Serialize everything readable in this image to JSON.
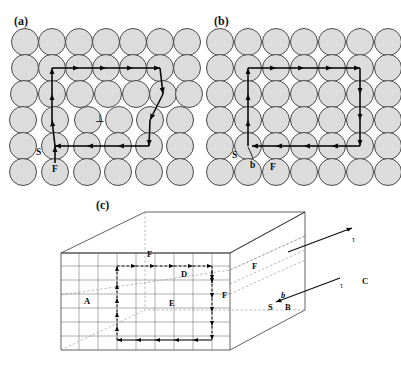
{
  "figure": {
    "type": "scientific-diagram",
    "background_color": "#ffffff",
    "atom_fill": "#dcdcdc",
    "atom_stroke": "#4a4a4a",
    "line_color": "#0a0a0a"
  },
  "panels": [
    {
      "id": "a",
      "label": "(a)",
      "caption_text": "(a)",
      "description": "Edge dislocation in a lattice with a Burgers circuit that fails to close",
      "lattice": {
        "rows": 6,
        "columns_top": 7,
        "columns_bottom": 6,
        "atom_radius": 13.5,
        "spacing_x": 27,
        "spacing_y": 26
      },
      "markers": [
        {
          "name": "start-label",
          "text": "S",
          "x": 39,
          "y": 152
        },
        {
          "name": "finish-label",
          "text": "F",
          "x": 58,
          "y": 170
        },
        {
          "name": "dislocation-symbol",
          "text": "⊥",
          "x": 100,
          "y": 118
        }
      ],
      "circuit": {
        "closed": false,
        "closure_failure": "Burgers vector b",
        "steps_right": 4,
        "steps_down": 4,
        "steps_left": 4,
        "steps_up": 4
      }
    },
    {
      "id": "b",
      "label": "(b)",
      "caption_text": "(b)",
      "description": "Same circuit traced in a perfect reference lattice, closing exactly",
      "lattice": {
        "rows": 6,
        "columns_top": 7,
        "columns_bottom": 7,
        "atom_radius": 13.5,
        "spacing_x": 27,
        "spacing_y": 26
      },
      "markers": [
        {
          "name": "start-label",
          "text": "S",
          "x": 236,
          "y": 155
        },
        {
          "name": "burgers-label",
          "text": "b",
          "x": 253,
          "y": 166
        },
        {
          "name": "finish-label",
          "text": "F",
          "x": 272,
          "y": 168
        }
      ],
      "circuit": {
        "closed": true,
        "steps_right": 4,
        "steps_down": 4,
        "steps_left": 4,
        "steps_up": 4
      }
    },
    {
      "id": "c",
      "label": "(c)",
      "caption_text": "(c)",
      "description": "Three dimensional crystal block containing a mixed dislocation line, with Burgers circuits on the front and side faces",
      "markers": [
        {
          "name": "vertex-label-a",
          "text": "A",
          "x": 88,
          "y": 301
        },
        {
          "name": "vertex-label-b",
          "text": "B",
          "x": 287,
          "y": 307
        },
        {
          "name": "vertex-label-c",
          "text": "C",
          "x": 363,
          "y": 281
        },
        {
          "name": "vertex-label-d",
          "text": "D",
          "x": 184,
          "y": 274
        },
        {
          "name": "vertex-label-e",
          "text": "E",
          "x": 172,
          "y": 303
        },
        {
          "name": "vertex-label-f-top",
          "text": "F",
          "x": 150,
          "y": 254
        },
        {
          "name": "vertex-label-f-mid",
          "text": "F",
          "x": 224,
          "y": 295
        },
        {
          "name": "vertex-label-f-right",
          "text": "F",
          "x": 254,
          "y": 266
        },
        {
          "name": "start-label",
          "text": "S",
          "x": 272,
          "y": 307
        },
        {
          "name": "burgers-label",
          "text": "b",
          "x": 283,
          "y": 294
        },
        {
          "name": "tau-label-upper",
          "text": "τ",
          "x": 357,
          "y": 243
        },
        {
          "name": "tau-label-lower",
          "text": "τ",
          "x": 345,
          "y": 288
        }
      ]
    }
  ]
}
